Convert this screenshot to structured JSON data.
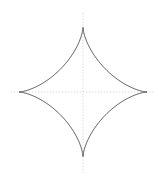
{
  "figure": {
    "background_color": "#ffffff",
    "width": 168,
    "height": 181
  },
  "chart_data": {
    "type": "line",
    "subtitle": "",
    "xlabel": "",
    "ylabel": "",
    "grid": false,
    "legend_position": "none",
    "tick_labels_x": [],
    "tick_labels_y": [],
    "xlim": [
      -1.15,
      1.15
    ],
    "ylim": [
      -1.15,
      1.15
    ],
    "annotations": [],
    "series": [
      {
        "name": "astroid",
        "curve_type": "parametric",
        "equation": "x = a*cos(t)^3, y = a*sin(t)^3",
        "cartesian": "x^(2/3) + y^(2/3) = a^(2/3)",
        "a": 1,
        "color": "#3c3c3c",
        "line_width": 0.9,
        "closed": true,
        "cusps": [
          {
            "label": "right",
            "x": 1,
            "y": 0
          },
          {
            "label": "top",
            "x": 0,
            "y": 1
          },
          {
            "label": "left",
            "x": -1,
            "y": 0
          },
          {
            "label": "bottom",
            "x": 0,
            "y": -1
          }
        ],
        "x": [
          1.0,
          0.9595,
          0.8365,
          0.6495,
          0.4284,
          0.2165,
          0.0529,
          0.0,
          -0.0529,
          -0.2165,
          -0.4284,
          -0.6495,
          -0.8365,
          -0.9595,
          -1.0,
          -0.9595,
          -0.8365,
          -0.6495,
          -0.4284,
          -0.2165,
          -0.0529,
          0.0,
          0.0529,
          0.2165,
          0.4284,
          0.6495,
          0.8365,
          0.9595,
          1.0
        ],
        "y": [
          0.0,
          0.0029,
          0.0233,
          0.0739,
          0.1664,
          0.2963,
          0.4167,
          0.5,
          0.5833,
          0.7037,
          0.8336,
          0.9261,
          0.9767,
          0.9971,
          1.0,
          0.9971,
          0.9767,
          0.9261,
          0.8336,
          0.7037,
          0.5833,
          0.5,
          0.4167,
          0.2963,
          0.1664,
          0.0739,
          0.0233,
          0.0029,
          0.0
        ]
      }
    ],
    "axes": {
      "visible": true,
      "style": "dotted",
      "color": "#b4b4b4",
      "line_width": 0.7,
      "horizontal": {
        "y": 0,
        "x_from": -1.12,
        "x_to": 1.12
      },
      "vertical": {
        "x": 0,
        "y_from": -1.25,
        "y_to": 1.25
      }
    },
    "geometry_px": {
      "center_x": 83,
      "center_y": 92,
      "radius_x": 64,
      "radius_y": 64.5,
      "cusp_left_x": 19,
      "cusp_right_x": 147,
      "cusp_top_y": 27,
      "cusp_bottom_y": 156
    }
  }
}
